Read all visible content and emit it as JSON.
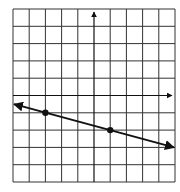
{
  "chart_data": {
    "type": "line",
    "title": "",
    "xlabel": "",
    "ylabel": "",
    "xlim": [
      -5,
      5
    ],
    "ylim": [
      -5,
      5
    ],
    "grid": true,
    "points": [
      {
        "x": -3,
        "y": -1
      },
      {
        "x": 1,
        "y": -2
      }
    ],
    "line": {
      "slope": -0.25,
      "intercept": -1.75,
      "x_start": -5,
      "x_end": 5,
      "arrows": "both"
    },
    "axes_arrows": {
      "x": "positive",
      "y": "positive"
    }
  },
  "colors": {
    "grid": "#333333",
    "line": "#111111",
    "background": "#ffffff"
  }
}
